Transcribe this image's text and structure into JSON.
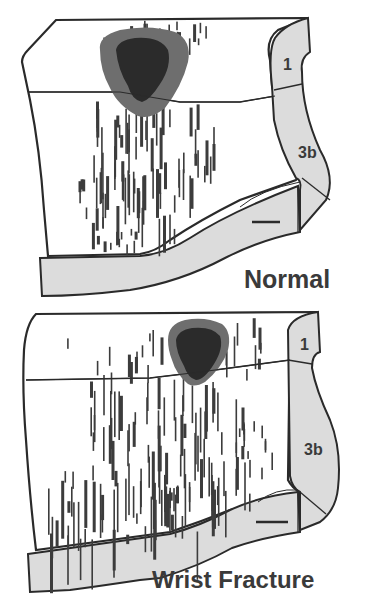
{
  "figure": {
    "panels": [
      {
        "id": "normal",
        "label": "Normal",
        "region_labels": [
          "1",
          "3b"
        ],
        "scale_bar": "—"
      },
      {
        "id": "wrist-fracture",
        "label": "Wrist Fracture",
        "region_labels": [
          "1",
          "3b"
        ],
        "scale_bar": "—"
      }
    ],
    "legend": {
      "core_zone": "dark core",
      "surround_zone": "grey surround",
      "recording_sites": "vertical receptive-field bars"
    }
  },
  "colors": {
    "outline": "#2a2a2a",
    "strip_fill": "#dcdcdc",
    "core_dark": "#2b2b2b",
    "surround_grey": "#6e6e6e",
    "bars": "#3c3c3c",
    "background": "#ffffff"
  }
}
